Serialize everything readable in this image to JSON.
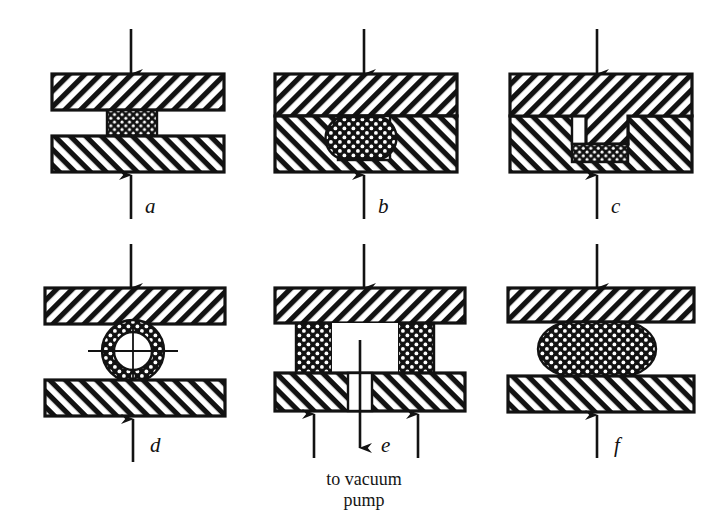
{
  "figure": {
    "kind": "technical-line-diagram",
    "background_color": "#ffffff",
    "ink_color": "#121212",
    "caption": {
      "line1": "to vacuum",
      "line2": "pump"
    },
    "panels": [
      {
        "id": "a",
        "label": "a",
        "title": "flat-platen compression of a prismatic specimen",
        "specimen_shape": "rectangular-block",
        "load_arrows": [
          "down-top",
          "up-bottom"
        ]
      },
      {
        "id": "b",
        "label": "b",
        "title": "specimen contained in a closed die cavity",
        "specimen_shape": "round-barrel-in-cavity",
        "load_arrows": [
          "down-top",
          "up-bottom"
        ]
      },
      {
        "id": "c",
        "label": "c",
        "title": "punch descending into a recess over the specimen",
        "specimen_shape": "flat-slab-under-punch",
        "load_arrows": [
          "down-top",
          "up-bottom"
        ]
      },
      {
        "id": "d",
        "label": "d",
        "title": "ring compression test with centrelines",
        "specimen_shape": "annular-ring",
        "load_arrows": [
          "down-top",
          "up-bottom"
        ]
      },
      {
        "id": "e",
        "label": "e",
        "title": "twin specimens with evacuated central chamber",
        "specimen_shape": "two-side-columns",
        "load_arrows": [
          "down-top",
          "up-bottom-left",
          "up-bottom-right",
          "down-centre-vacuum"
        ]
      },
      {
        "id": "f",
        "label": "f",
        "title": "barrelled specimen between flat platens",
        "specimen_shape": "barrelled-ellipse",
        "load_arrows": [
          "down-top",
          "up-bottom"
        ]
      }
    ]
  }
}
